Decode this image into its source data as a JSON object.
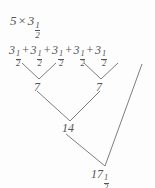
{
  "diagram": {
    "type": "repeated-addition-tree",
    "background_color": "#fdfdfd",
    "line_color": "#7d7d7d",
    "text_color": "#555555",
    "title": {
      "whole": "5",
      "operator": "×",
      "factor_whole": "3",
      "factor_num": "1",
      "factor_den": "2",
      "full_text": "5 × 3 1/2"
    },
    "sum_row": {
      "operator": "+",
      "terms": [
        {
          "whole": "3",
          "num": "1",
          "den": "2"
        },
        {
          "whole": "3",
          "num": "1",
          "den": "2"
        },
        {
          "whole": "3",
          "num": "1",
          "den": "2"
        },
        {
          "whole": "3",
          "num": "1",
          "den": "2"
        },
        {
          "whole": "3",
          "num": "1",
          "den": "2"
        }
      ]
    },
    "nodes": {
      "partial_sum_left": "7",
      "partial_sum_right": "7",
      "partial_sum_total": "14",
      "final_whole": "17",
      "final_num": "1",
      "final_den": "2",
      "final_text": "17 1/2"
    },
    "connectors": [
      {
        "name": "term1-to-7a",
        "x1": 22,
        "y1": 63,
        "x2": 39,
        "y2": 79
      },
      {
        "name": "term2-to-7a",
        "x1": 56,
        "y1": 63,
        "x2": 39,
        "y2": 79
      },
      {
        "name": "term3-to-7b",
        "x1": 84,
        "y1": 63,
        "x2": 101,
        "y2": 79
      },
      {
        "name": "term4-to-7b",
        "x1": 118,
        "y1": 63,
        "x2": 101,
        "y2": 79
      },
      {
        "name": "7a-to-14",
        "x1": 37,
        "y1": 91,
        "x2": 70,
        "y2": 121
      },
      {
        "name": "7b-to-14",
        "x1": 100,
        "y1": 91,
        "x2": 70,
        "y2": 121
      },
      {
        "name": "14-to-17h",
        "x1": 66,
        "y1": 134,
        "x2": 105,
        "y2": 166
      },
      {
        "name": "term5-to-17h",
        "x1": 142,
        "y1": 64,
        "x2": 105,
        "y2": 166
      }
    ]
  }
}
